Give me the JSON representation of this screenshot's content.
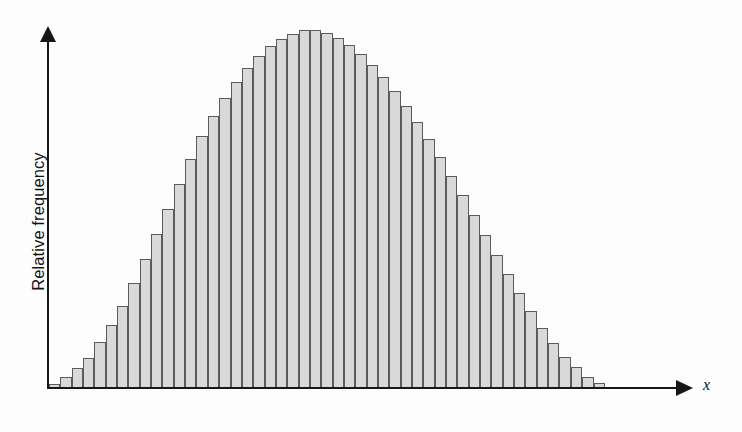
{
  "figure": {
    "background_color": "#fdfdfd",
    "axis_color": "#171717"
  },
  "axes": {
    "y": {
      "label": "Relative frequency",
      "has_arrow": true,
      "has_ticks": false,
      "has_tick_labels": false
    },
    "x": {
      "label": "x",
      "has_arrow": true,
      "has_ticks": false,
      "has_tick_labels": false
    }
  },
  "style": {
    "bar_fill": "#d9d9d9",
    "bar_stroke": "#5b5b5b"
  },
  "chart_data": {
    "type": "bar",
    "title": "",
    "subtitle": "",
    "xlabel": "x",
    "ylabel": "Relative frequency",
    "grid": false,
    "legend": false,
    "legend_position": "none",
    "xlim": [
      0,
      49
    ],
    "ylim": [
      0,
      1
    ],
    "axis_tick_labels": {
      "x": [],
      "y": []
    },
    "bar_count": 49,
    "categories": [
      "1",
      "2",
      "3",
      "4",
      "5",
      "6",
      "7",
      "8",
      "9",
      "10",
      "11",
      "12",
      "13",
      "14",
      "15",
      "16",
      "17",
      "18",
      "19",
      "20",
      "21",
      "22",
      "23",
      "24",
      "25",
      "26",
      "27",
      "28",
      "29",
      "30",
      "31",
      "32",
      "33",
      "34",
      "35",
      "36",
      "37",
      "38",
      "39",
      "40",
      "41",
      "42",
      "43",
      "44",
      "45",
      "46",
      "47",
      "48",
      "49"
    ],
    "values": [
      0.012,
      0.03,
      0.055,
      0.085,
      0.128,
      0.175,
      0.228,
      0.292,
      0.36,
      0.43,
      0.5,
      0.57,
      0.64,
      0.705,
      0.76,
      0.81,
      0.855,
      0.895,
      0.928,
      0.955,
      0.975,
      0.99,
      1.0,
      1.0,
      0.992,
      0.978,
      0.958,
      0.932,
      0.902,
      0.868,
      0.83,
      0.788,
      0.742,
      0.695,
      0.645,
      0.592,
      0.538,
      0.482,
      0.428,
      0.372,
      0.318,
      0.265,
      0.215,
      0.168,
      0.125,
      0.088,
      0.058,
      0.032,
      0.014
    ],
    "peak": {
      "category": "23",
      "value": 1.0
    }
  }
}
